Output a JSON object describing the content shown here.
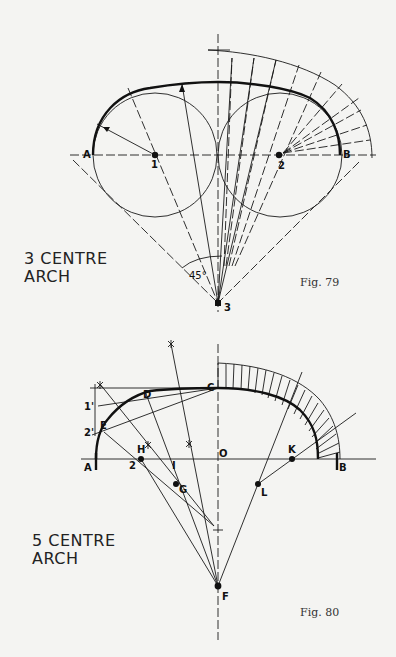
{
  "figures": [
    {
      "id": "fig79",
      "title_line1": "3 CENTRE",
      "title_line2": "ARCH",
      "caption": "Fig. 79",
      "angle_label": "45°",
      "points": {
        "A": "A",
        "B": "B",
        "c1": "1",
        "c2": "2",
        "c3": "3"
      }
    },
    {
      "id": "fig80",
      "title_line1": "5 CENTRE",
      "title_line2": "ARCH",
      "caption": "Fig. 80",
      "points": {
        "A": "A",
        "B": "B",
        "C": "C",
        "D": "D",
        "E": "E",
        "O": "O",
        "F": "F",
        "G": "G",
        "H": "H",
        "I": "I",
        "K": "K",
        "L": "L",
        "two": "2",
        "one_prime": "1'",
        "two_prime": "2'"
      }
    }
  ]
}
